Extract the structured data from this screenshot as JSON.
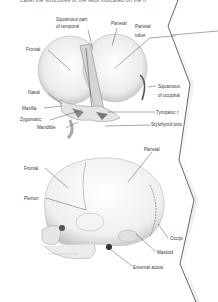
{
  "page": {
    "caption_text": "Label the structures of the skull indicated on the fi"
  },
  "figure_top": {
    "title": "Anterolateral view of infant skull",
    "labels": [
      {
        "text": "Squamous part",
        "x": 56,
        "y": 17
      },
      {
        "text": "of temporal",
        "x": 56,
        "y": 24
      },
      {
        "text": "Parietal",
        "x": 111,
        "y": 21
      },
      {
        "text": "Parietal",
        "x": 135,
        "y": 24
      },
      {
        "text": "tuber",
        "x": 135,
        "y": 33
      },
      {
        "text": "Frontal",
        "x": 26,
        "y": 47
      },
      {
        "text": "Nasal",
        "x": 28,
        "y": 90
      },
      {
        "text": "Squamous",
        "x": 158,
        "y": 84
      },
      {
        "text": "of occipital",
        "x": 158,
        "y": 93
      },
      {
        "text": "Maxilla",
        "x": 22,
        "y": 106
      },
      {
        "text": "Tympanic r",
        "x": 156,
        "y": 110
      },
      {
        "text": "Zygomatic",
        "x": 20,
        "y": 117
      },
      {
        "text": "Stylohyoid proc",
        "x": 151,
        "y": 122
      },
      {
        "text": "Mandible",
        "x": 37,
        "y": 125
      }
    ]
  },
  "figure_bottom": {
    "title": "Lateral view of infant skull",
    "labels": [
      {
        "text": "Parietal",
        "x": 144,
        "y": 147
      },
      {
        "text": "Frontal",
        "x": 24,
        "y": 166
      },
      {
        "text": "Pterion",
        "x": 24,
        "y": 196
      },
      {
        "text": "Occipi",
        "x": 170,
        "y": 236
      },
      {
        "text": "Mastoid",
        "x": 157,
        "y": 250
      },
      {
        "text": "External acous",
        "x": 133,
        "y": 265
      }
    ]
  },
  "colors": {
    "ink": "#3a3a3a",
    "bone_shade": "#d0d0d0",
    "edge": "#555555"
  }
}
